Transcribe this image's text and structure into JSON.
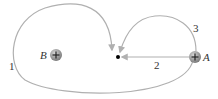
{
  "diagram": {
    "charges": [
      {
        "id": "A",
        "label": "A",
        "sign": "+"
      },
      {
        "id": "B",
        "label": "B",
        "sign": "+"
      }
    ],
    "paths": [
      {
        "id": "1",
        "label": "1"
      },
      {
        "id": "2",
        "label": "2"
      },
      {
        "id": "3",
        "label": "3"
      }
    ],
    "colors": {
      "path": "#b0b0b0",
      "charge": "#8a8a8a",
      "point": "#000000"
    }
  }
}
